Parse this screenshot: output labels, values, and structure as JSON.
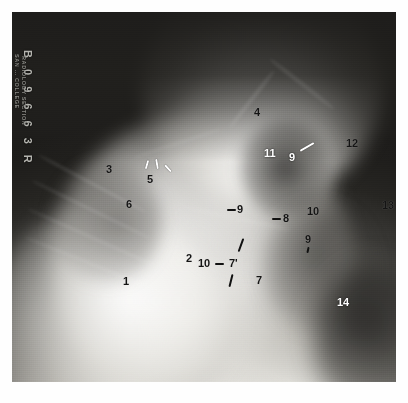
{
  "image": {
    "modality": "radiograph",
    "view": "lateral shoulder / scapular Y projection",
    "film_id": {
      "number": "B 0 9 6 6 3 R",
      "line1": "RADIOLOGY SECTION",
      "line2": "SAN ... COLLEGE"
    },
    "colors": {
      "label_dark": "#141414",
      "label_light": "#ffffff",
      "film_background": "#1d1d1d",
      "page_background": "#ffffff"
    }
  },
  "annotations": [
    {
      "id": "a1",
      "text": "1",
      "x": 123,
      "y": 281,
      "tone": "dark",
      "leader": "none"
    },
    {
      "id": "a2",
      "text": "2",
      "x": 186,
      "y": 258,
      "tone": "dark",
      "leader": "none"
    },
    {
      "id": "a3",
      "text": "3",
      "x": 106,
      "y": 169,
      "tone": "dark",
      "leader": "none"
    },
    {
      "id": "a4",
      "text": "4",
      "x": 254,
      "y": 112,
      "tone": "dark",
      "leader": "none"
    },
    {
      "id": "a5",
      "text": "5",
      "x": 147,
      "y": 179,
      "tone": "dark",
      "leader": "ticks"
    },
    {
      "id": "a6",
      "text": "6",
      "x": 126,
      "y": 204,
      "tone": "dark",
      "leader": "none"
    },
    {
      "id": "a7",
      "text": "7",
      "x": 256,
      "y": 280,
      "tone": "dark",
      "leader": "none"
    },
    {
      "id": "a7p",
      "text": "7'",
      "x": 229,
      "y": 263,
      "tone": "dark",
      "leader": "ticks"
    },
    {
      "id": "a8",
      "text": "8",
      "x": 283,
      "y": 218,
      "tone": "dark",
      "leader": "dash-left"
    },
    {
      "id": "a9a",
      "text": "9",
      "x": 237,
      "y": 209,
      "tone": "dark",
      "leader": "dash-left"
    },
    {
      "id": "a9b",
      "text": "9",
      "x": 289,
      "y": 157,
      "tone": "light",
      "leader": "slash-right"
    },
    {
      "id": "a9c",
      "text": "9",
      "x": 305,
      "y": 239,
      "tone": "dark",
      "leader": "tick-below"
    },
    {
      "id": "a10a",
      "text": "10",
      "x": 198,
      "y": 263,
      "tone": "dark",
      "leader": "dash-right"
    },
    {
      "id": "a10b",
      "text": "10",
      "x": 307,
      "y": 211,
      "tone": "dark",
      "leader": "none"
    },
    {
      "id": "a11",
      "text": "11",
      "x": 264,
      "y": 153,
      "tone": "light",
      "leader": "none"
    },
    {
      "id": "a12",
      "text": "12",
      "x": 346,
      "y": 143,
      "tone": "dark",
      "leader": "none"
    },
    {
      "id": "a13",
      "text": "13",
      "x": 382,
      "y": 205,
      "tone": "dark",
      "leader": "none"
    },
    {
      "id": "a14",
      "text": "14",
      "x": 337,
      "y": 302,
      "tone": "light",
      "leader": "none"
    }
  ]
}
